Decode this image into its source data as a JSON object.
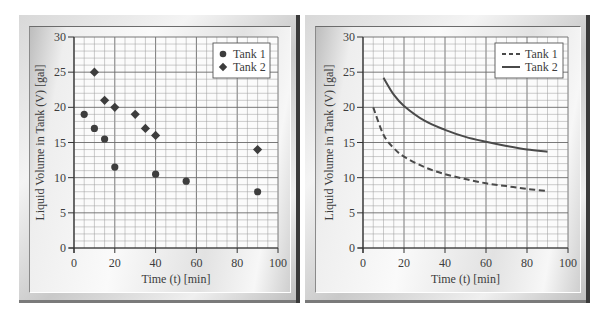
{
  "chart_data": [
    {
      "type": "scatter",
      "title": "",
      "xlabel": "Time (t) [min]",
      "ylabel": "Liquid Volume in Tank (V) [gal]",
      "xlim": [
        0,
        100
      ],
      "ylim": [
        0,
        30
      ],
      "xticks": [
        0,
        20,
        40,
        60,
        80,
        100
      ],
      "yticks": [
        0,
        5,
        10,
        15,
        20,
        25,
        30
      ],
      "grid": {
        "on": true,
        "x_minor_step": 5,
        "y_minor_step": 1
      },
      "legend_position": "upper right",
      "series": [
        {
          "name": "Tank 1",
          "marker": "circle",
          "x": [
            5,
            10,
            15,
            20,
            40,
            55,
            90
          ],
          "y": [
            19,
            17,
            15.5,
            11.5,
            10.5,
            9.5,
            8
          ]
        },
        {
          "name": "Tank 2",
          "marker": "diamond",
          "x": [
            10,
            15,
            20,
            30,
            35,
            40,
            90
          ],
          "y": [
            25,
            21,
            20,
            19,
            17,
            16,
            14
          ]
        }
      ]
    },
    {
      "type": "line",
      "title": "",
      "xlabel": "Time (t) [min]",
      "ylabel": "Liquid Volume in Tank (V) [gal]",
      "xlim": [
        0,
        100
      ],
      "ylim": [
        0,
        30
      ],
      "xticks": [
        0,
        20,
        40,
        60,
        80,
        100
      ],
      "yticks": [
        0,
        5,
        10,
        15,
        20,
        25,
        30
      ],
      "grid": {
        "on": true,
        "x_minor_step": 5,
        "y_minor_step": 1
      },
      "legend_position": "upper right",
      "series": [
        {
          "name": "Tank 1",
          "style": "dashed",
          "x": [
            5,
            10,
            15,
            20,
            30,
            40,
            50,
            60,
            70,
            80,
            90
          ],
          "y": [
            20.0,
            16.1,
            14.2,
            13.0,
            11.5,
            10.5,
            9.8,
            9.2,
            8.8,
            8.4,
            8.1
          ]
        },
        {
          "name": "Tank 2",
          "style": "solid",
          "x": [
            10,
            15,
            20,
            30,
            40,
            50,
            60,
            70,
            80,
            90
          ],
          "y": [
            24.2,
            21.8,
            20.2,
            18.1,
            16.8,
            15.8,
            15.1,
            14.5,
            14.0,
            13.7
          ]
        }
      ]
    }
  ],
  "colors": {
    "marker": "#3d3d3d",
    "line": "#4a4a4a",
    "grid_major": "#6a6a6a",
    "grid_minor": "#9a9a9a",
    "axis": "#333333",
    "text": "#3c3c3c"
  }
}
